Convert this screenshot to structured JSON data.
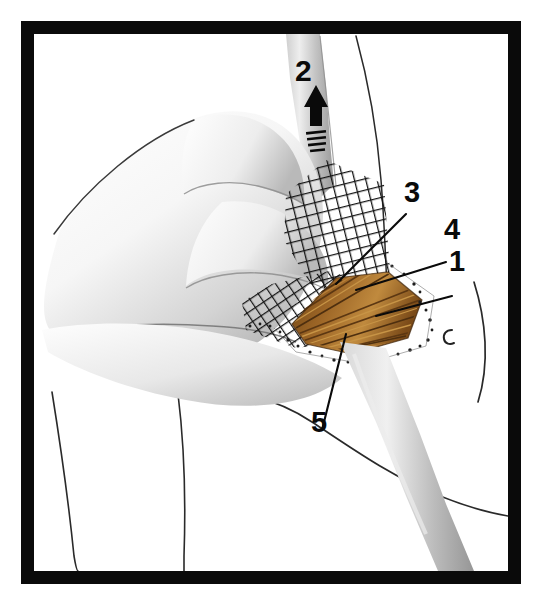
{
  "figure": {
    "domain": "anatomical-surgical-illustration",
    "background_color": "#ffffff",
    "frame": {
      "color": "#0a0a0a",
      "thickness_px": 13,
      "style": "solid-black-rectangle"
    },
    "palette": {
      "frame_black": "#0a0a0a",
      "ink_black": "#111111",
      "muscle_brown": "#8b5a22",
      "muscle_brown_dark": "#5c3712",
      "muscle_brown_light": "#c08a3e",
      "skin_gray_light": "#f2f2f2",
      "skin_gray_mid": "#c9c9c9",
      "skin_gray_dark": "#8e8e8e",
      "gauze_black": "#141414",
      "paper_white": "#ffffff"
    }
  },
  "callouts": [
    {
      "id": "1",
      "label": "1",
      "x": 449,
      "y": 247,
      "leader": true,
      "description": "leader line from label down-left to lateral edge of exposed muscle"
    },
    {
      "id": "2",
      "label": "2",
      "x": 295,
      "y": 56,
      "leader": false,
      "description": "label above black arrow pointing upward with motion lines, indicating traction direction"
    },
    {
      "id": "3",
      "label": "3",
      "x": 404,
      "y": 178,
      "leader": true,
      "description": "leader line from label down-left to upper margin of exposed muscle belly"
    },
    {
      "id": "4",
      "label": "4",
      "x": 444,
      "y": 215,
      "leader": true,
      "description": "leader line from label down-left to mid portion of exposed muscle"
    },
    {
      "id": "5",
      "label": "5",
      "x": 311,
      "y": 408,
      "leader": true,
      "description": "leader line from label upward into the center of the exposed muscle fibers"
    }
  ],
  "arrow": {
    "name": "traction-arrow",
    "direction": "up",
    "color": "#0a0a0a",
    "motion_lines": 4,
    "x": 300,
    "y": 88
  },
  "elements": {
    "hand": "surgeon hand with fingers retracting tissue, rendered in airbrushed gray tones",
    "gauze": "crosshatched square-weave surgical gauze/mesh draped over wound edge",
    "muscle": "fan shaped brown-ochre striated muscle fibers exposed in the wound",
    "incision_edge": "stippled dotted line marking the cut skin margin",
    "shaft": "tapering gray shaft (bone / instrument) running diagonally from top to lower right",
    "body_outline": "thin ink contour lines of shoulder, arm and torso",
    "small_mark": "small c-shaped ink mark to the right of the wound"
  }
}
